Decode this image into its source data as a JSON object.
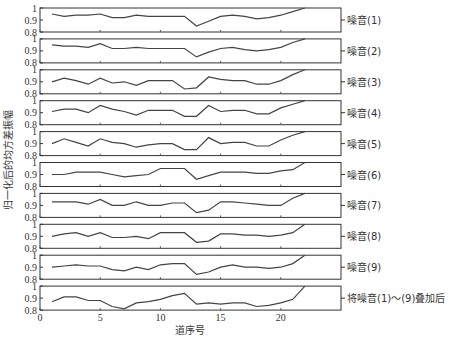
{
  "chart_data": {
    "type": "line",
    "title": "",
    "xlabel": "道序号",
    "ylabel": "归一化后的均方差振幅",
    "xlim": [
      0,
      25
    ],
    "ylim": [
      0.8,
      1.0
    ],
    "x_ticks": [
      "0",
      "5",
      "10",
      "15",
      "20"
    ],
    "x_tick_values": [
      0,
      5,
      10,
      15,
      20
    ],
    "y_ticks": [
      "1",
      "0.9",
      "0.8"
    ],
    "y_tick_values": [
      1.0,
      0.9,
      0.8
    ],
    "grid": false,
    "x": [
      1,
      2,
      3,
      4,
      5,
      6,
      7,
      8,
      9,
      10,
      11,
      12,
      13,
      14,
      15,
      16,
      17,
      18,
      19,
      20,
      21,
      22
    ],
    "series": [
      {
        "name": "噪音(1)",
        "values": [
          0.95,
          0.93,
          0.94,
          0.94,
          0.95,
          0.92,
          0.92,
          0.94,
          0.93,
          0.93,
          0.93,
          0.93,
          0.85,
          0.89,
          0.93,
          0.94,
          0.93,
          0.91,
          0.92,
          0.94,
          0.97,
          1.0
        ]
      },
      {
        "name": "噪音(2)",
        "values": [
          0.95,
          0.94,
          0.94,
          0.93,
          0.96,
          0.92,
          0.92,
          0.93,
          0.92,
          0.92,
          0.92,
          0.92,
          0.85,
          0.89,
          0.92,
          0.93,
          0.91,
          0.9,
          0.91,
          0.93,
          0.97,
          1.0
        ]
      },
      {
        "name": "噪音(3)",
        "values": [
          0.9,
          0.93,
          0.91,
          0.88,
          0.93,
          0.89,
          0.9,
          0.87,
          0.91,
          0.91,
          0.91,
          0.84,
          0.85,
          0.94,
          0.92,
          0.91,
          0.91,
          0.88,
          0.88,
          0.91,
          0.96,
          1.0
        ]
      },
      {
        "name": "噪音(4)",
        "values": [
          0.91,
          0.93,
          0.93,
          0.9,
          0.96,
          0.93,
          0.91,
          0.88,
          0.92,
          0.92,
          0.92,
          0.87,
          0.87,
          0.96,
          0.91,
          0.92,
          0.92,
          0.89,
          0.89,
          0.94,
          0.97,
          1.0
        ]
      },
      {
        "name": "噪音(5)",
        "values": [
          0.9,
          0.94,
          0.91,
          0.88,
          0.94,
          0.91,
          0.9,
          0.87,
          0.89,
          0.9,
          0.9,
          0.85,
          0.85,
          0.95,
          0.9,
          0.91,
          0.91,
          0.88,
          0.88,
          0.93,
          0.97,
          1.0
        ]
      },
      {
        "name": "噪音(6)",
        "values": [
          0.9,
          0.9,
          0.92,
          0.92,
          0.92,
          0.9,
          0.88,
          0.89,
          0.9,
          0.95,
          0.95,
          0.95,
          0.86,
          0.89,
          0.92,
          0.92,
          0.92,
          0.91,
          0.91,
          0.93,
          0.94,
          1.0
        ]
      },
      {
        "name": "噪音(7)",
        "values": [
          0.93,
          0.93,
          0.93,
          0.91,
          0.95,
          0.9,
          0.9,
          0.93,
          0.9,
          0.9,
          0.92,
          0.92,
          0.84,
          0.86,
          0.93,
          0.93,
          0.92,
          0.91,
          0.9,
          0.9,
          0.96,
          1.0
        ]
      },
      {
        "name": "噪音(8)",
        "values": [
          0.9,
          0.92,
          0.93,
          0.9,
          0.93,
          0.89,
          0.89,
          0.9,
          0.88,
          0.93,
          0.93,
          0.93,
          0.85,
          0.86,
          0.92,
          0.92,
          0.91,
          0.91,
          0.9,
          0.91,
          0.93,
          1.0
        ]
      },
      {
        "name": "噪音(9)",
        "values": [
          0.9,
          0.91,
          0.92,
          0.91,
          0.91,
          0.88,
          0.87,
          0.9,
          0.88,
          0.92,
          0.93,
          0.93,
          0.84,
          0.86,
          0.9,
          0.92,
          0.9,
          0.9,
          0.89,
          0.9,
          0.93,
          1.0
        ]
      },
      {
        "name": "将噪音(1)～(9)叠加后",
        "values": [
          0.87,
          0.91,
          0.91,
          0.88,
          0.88,
          0.83,
          0.81,
          0.86,
          0.87,
          0.89,
          0.92,
          0.94,
          0.85,
          0.86,
          0.85,
          0.86,
          0.86,
          0.83,
          0.84,
          0.86,
          0.89,
          1.0
        ]
      }
    ]
  },
  "caption_partial": ""
}
